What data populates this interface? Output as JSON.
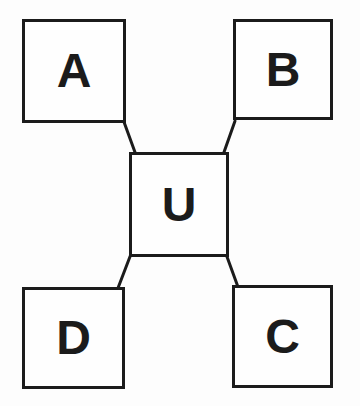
{
  "diagram": {
    "type": "hub-and-spoke",
    "nodes": [
      {
        "id": "A",
        "label": "A",
        "position": "top-left"
      },
      {
        "id": "B",
        "label": "B",
        "position": "top-right"
      },
      {
        "id": "U",
        "label": "U",
        "position": "center"
      },
      {
        "id": "D",
        "label": "D",
        "position": "bottom-left"
      },
      {
        "id": "C",
        "label": "C",
        "position": "bottom-right"
      }
    ],
    "edges": [
      {
        "from": "U",
        "to": "A"
      },
      {
        "from": "U",
        "to": "B"
      },
      {
        "from": "U",
        "to": "D"
      },
      {
        "from": "U",
        "to": "C"
      }
    ],
    "colors": {
      "stroke": "#1b1b1b",
      "node_fill": "#fefefe",
      "background": "#fdfdfd"
    }
  }
}
